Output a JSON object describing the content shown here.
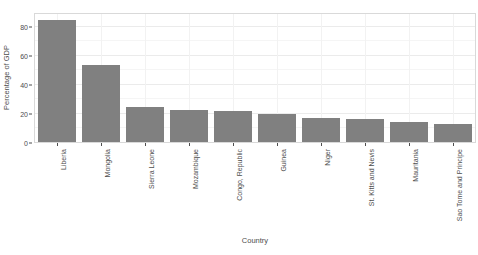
{
  "chart_data": {
    "type": "bar",
    "title": "",
    "xlabel": "Country",
    "ylabel": "Percentage of GDP",
    "categories": [
      "Liberia",
      "Mongolia",
      "Sierra Leone",
      "Mozambique",
      "Congo, Republic",
      "Guinea",
      "Niger",
      "St. Kitts and Nevis",
      "Mauritania",
      "Sao Tome and Principe"
    ],
    "values": [
      84,
      53,
      24,
      22,
      21.5,
      19,
      16.5,
      15.5,
      13.5,
      12.5
    ],
    "ylim": [
      0,
      88
    ],
    "y_ticks": [
      0,
      20,
      40,
      60,
      80
    ],
    "y_ticklabels": [
      "0",
      "20",
      "40",
      "60",
      "80"
    ],
    "grid": true,
    "legend": "none",
    "bar_color": "#808080",
    "panel_background": "#ffffff",
    "gridline_color": "#ebebeb",
    "axis_text_color": "#4d4d4d"
  }
}
